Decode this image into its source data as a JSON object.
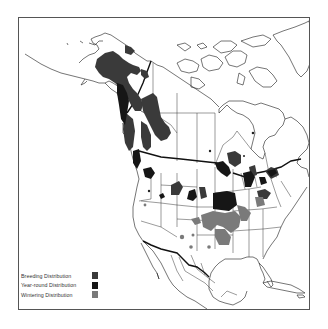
{
  "map": {
    "title": "",
    "region": "North America",
    "colors": {
      "outline": "#1a1a1a",
      "border_thick": "#111111",
      "breeding": "#3a3a3a",
      "year_round": "#161616",
      "wintering": "#7a7a7a",
      "frame": "#555555"
    }
  },
  "legend": {
    "items": [
      {
        "label": "Breeding Distribution",
        "color": "#3a3a3a"
      },
      {
        "label": "Year-round Distribution",
        "color": "#161616"
      },
      {
        "label": "Wintering Distribution",
        "color": "#7a7a7a"
      }
    ]
  }
}
